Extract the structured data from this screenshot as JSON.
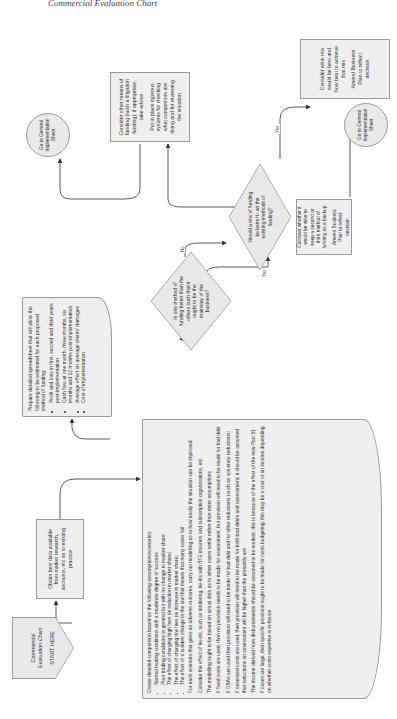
{
  "page": {
    "running_header": "Commercial Evaluation Chart"
  },
  "start": {
    "title": "Commercial Evaluation Chart",
    "subtitle": "START HERE"
  },
  "obtain_data": {
    "text": "Obtain best data available from market research, accounts, etc as to existing practice"
  },
  "comparison": {
    "intro": "Create detailed comparison based on the following assumptions/scenarios:",
    "bullets": [
      "Normal trading conditions with a moderate degree of success",
      "Poor trading conditions in general but with no change to market share",
      "The effect of charging high fees (ie reduction in market share)",
      "The effect of charging low fees (ie increase in market share)",
      "The effect of a sudden change in the law that means that many cases fail"
    ],
    "paragraphs": [
      "For each scenario that gives an adverse outcome, carry out modelling as to how easily the situation can be improved",
      "Consider the effect of tie-ins, such as tendering, tie-ins with BTE insurers and subscription organisations, etc",
      "The modelling ought to be based on actual data as to when cases settle rather than mere assumptions",
      "If fixed costs are used, then no provision needs to be made for assessment, but provision will need to be made for bad debt",
      "If DBAs are used then provision will need to be made for bad debt and for other reductions (such as voluntary reductions)",
      "If assessed costs are used, then provision will need to be made for both bad debts and assessment; it should be assumed that reductions on assessment will be higher than the presently are",
      "The income derived from disbursements should be assumed to be modest; this is because of the effect of the new Part 31",
      "If cases are large, then specific provision ought to be made for costs budgeting; this may be a cost or an income depending on whether costs expertise is in-house"
    ]
  },
  "spreadsheet": {
    "intro": "Prepare detailed spreadsheet that will allow the following to be estimated for each proposed method of funding:",
    "bullets": [
      "Profit and loss in first, second and third years post-implementation",
      "Cash flow at one month, three months, six months and 12 months post-implementation",
      "Average effect on average clients' damages",
      "Cost of implementation"
    ]
  },
  "decision_one": {
    "text": "Is one method of funding better than the others such that it ought to be the mainstay of the business?",
    "yes_label": "Yes",
    "no_label": "No"
  },
  "decision_mix": {
    "text": "Would a mix of funding be better than the existing methods of funding?",
    "yes_label": "Yes",
    "no_label": "No"
  },
  "backup_box": {
    "line1": "Consider whether it would be wise to keep a second or third method of funding as a backup",
    "line2": "Amend Business Plan to reflect decision"
  },
  "mix_box": {
    "line1": "Consider what mix would be best and how best to achieve that mix",
    "line2": "Amend Business Plan to reflect decision"
  },
  "other_funding": {
    "line1": "Consider other means of funding (such a litigation funding); if appropriate, take advice",
    "line2": "Put in place rigorous systems for checking what competitors are doing and for reviewing the situation"
  },
  "goto_left": {
    "text": "Go to General Implementation Sheet"
  },
  "goto_right": {
    "text": "Go to General Implementation Sheet"
  },
  "colors": {
    "shape_fill": "#efefef",
    "shape_border": "#9a9a9a",
    "connector": "#333333"
  }
}
